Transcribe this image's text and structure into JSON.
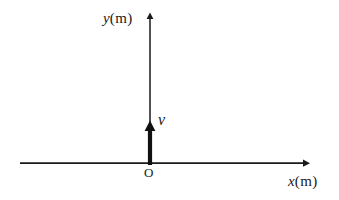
{
  "figure": {
    "kind": "physics-coordinate-diagram",
    "background_color": "#ffffff",
    "stroke_color": "#1a1a1a",
    "width": 339,
    "height": 200
  },
  "axes": {
    "x_axis": {
      "label_symbol": "x",
      "label_unit": "(m)",
      "label_full": "x (m)",
      "has_arrowhead": true,
      "arrow_direction": "right",
      "y_position": 163,
      "x_start": 20,
      "x_end": 308,
      "line_width": 1.6
    },
    "y_axis": {
      "label_symbol": "y",
      "label_unit": "(m)",
      "label_full": "y (m)",
      "has_arrowhead": true,
      "arrow_direction": "up",
      "x_position": 150,
      "y_start": 165,
      "y_end": 14,
      "line_width": 1.4
    },
    "origin": {
      "label": "O",
      "x": 150,
      "y": 163
    }
  },
  "vectors": [
    {
      "name": "velocity",
      "label": "v",
      "label_style": "italic",
      "direction": "up",
      "origin_x": 150,
      "origin_y": 164,
      "tip_y": 122,
      "shaft_width": 4,
      "color": "#111111"
    }
  ],
  "labels": {
    "y_axis_symbol": "y",
    "y_axis_unit": "(m)",
    "x_axis_symbol": "x",
    "x_axis_unit": "(m)",
    "origin": "O",
    "velocity": "v"
  }
}
